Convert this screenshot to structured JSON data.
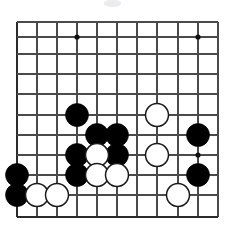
{
  "figure": {
    "kind": "go-board-diagram",
    "caption": ""
  },
  "board": {
    "columns": 11,
    "rows": 11,
    "column_x": [
      17,
      37,
      57,
      77,
      97,
      117,
      137,
      157,
      178,
      198,
      218
    ],
    "row_y": [
      22,
      37,
      54,
      74,
      94,
      115,
      135,
      155,
      175,
      195,
      217
    ],
    "edges": {
      "left_border": true,
      "bottom_border": true,
      "top_border": false,
      "right_border": false
    },
    "colors": {
      "background": "#ffffff",
      "grid_line": "#4a4a4a",
      "edge_line": "#2b2b2b",
      "black_stone": "#000000",
      "white_stone_fill": "#ffffff",
      "white_stone_edge": "#1a1a1a",
      "star_point": "#111111"
    },
    "stone_radius": 11.5,
    "star_points": [
      {
        "col": 3,
        "row": 1
      },
      {
        "col": 9,
        "row": 1
      },
      {
        "col": 9,
        "row": 7
      }
    ],
    "stones": [
      {
        "color": "black",
        "col": 3,
        "row": 5
      },
      {
        "color": "black",
        "col": 4,
        "row": 6
      },
      {
        "color": "black",
        "col": 5,
        "row": 6
      },
      {
        "color": "black",
        "col": 9,
        "row": 6
      },
      {
        "color": "black",
        "col": 3,
        "row": 7
      },
      {
        "color": "black",
        "col": 5,
        "row": 7
      },
      {
        "color": "black",
        "col": 0,
        "row": 8
      },
      {
        "color": "black",
        "col": 3,
        "row": 8
      },
      {
        "color": "black",
        "col": 9,
        "row": 8
      },
      {
        "color": "black",
        "col": 0,
        "row": 9
      },
      {
        "color": "white",
        "col": 7,
        "row": 5
      },
      {
        "color": "white",
        "col": 4,
        "row": 7
      },
      {
        "color": "white",
        "col": 7,
        "row": 7
      },
      {
        "color": "white",
        "col": 4,
        "row": 8
      },
      {
        "color": "white",
        "col": 5,
        "row": 8
      },
      {
        "color": "white",
        "col": 1,
        "row": 9
      },
      {
        "color": "white",
        "col": 2,
        "row": 9
      },
      {
        "color": "white",
        "col": 8,
        "row": 9
      }
    ]
  }
}
